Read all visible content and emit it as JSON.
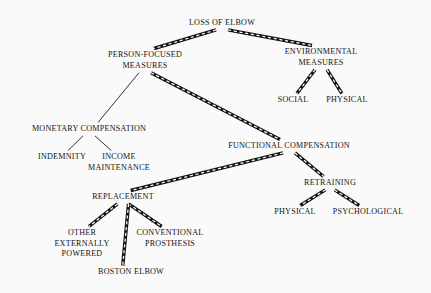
{
  "diagram": {
    "title": "LOSS OF ELBOW",
    "type": "hierarchy-tree",
    "background_color": "#fafafa",
    "text_color": "#141414",
    "line_styles": {
      "thin": "single thin solid black line",
      "thick": "thick double outline with white dashes between (railroad style)"
    },
    "nodes": [
      {
        "id": "loss-of-elbow",
        "label": "LOSS OF ELBOW",
        "x": 222,
        "y": 18,
        "level": 0
      },
      {
        "id": "person-focused-measures",
        "label": "PERSON-FOCUSED\nMEASURES",
        "x": 145,
        "y": 50,
        "level": 1
      },
      {
        "id": "environmental-measures",
        "label": "ENVIRONMENTAL\nMEASURES",
        "x": 321,
        "y": 47,
        "level": 1
      },
      {
        "id": "social",
        "label": "SOCIAL",
        "x": 293,
        "y": 95,
        "level": 2
      },
      {
        "id": "physical-env",
        "label": "PHYSICAL",
        "x": 347,
        "y": 95,
        "level": 2
      },
      {
        "id": "monetary-compensation",
        "label": "MONETARY COMPENSATION",
        "x": 89,
        "y": 124,
        "level": 2
      },
      {
        "id": "indemnity",
        "label": "INDEMNITY",
        "x": 62,
        "y": 152,
        "level": 3
      },
      {
        "id": "income-maintenance",
        "label": "INCOME\nMAINTENANCE",
        "x": 119,
        "y": 152,
        "level": 3
      },
      {
        "id": "functional-compensation",
        "label": "FUNCTIONAL COMPENSATION",
        "x": 289,
        "y": 141,
        "level": 2
      },
      {
        "id": "retraining",
        "label": "RETRAINING",
        "x": 330,
        "y": 178,
        "level": 3
      },
      {
        "id": "physical-retrain",
        "label": "PHYSICAL",
        "x": 295,
        "y": 207,
        "level": 4
      },
      {
        "id": "psychological",
        "label": "PSYCHOLOGICAL",
        "x": 368,
        "y": 207,
        "level": 4
      },
      {
        "id": "replacement",
        "label": "REPLACEMENT",
        "x": 123,
        "y": 192,
        "level": 3
      },
      {
        "id": "other-externally-powered",
        "label": "OTHER\nEXTERNALLY\nPOWERED",
        "x": 82,
        "y": 228,
        "level": 4
      },
      {
        "id": "conventional-prosthesis",
        "label": "CONVENTIONAL\nPROSTHESIS",
        "x": 170,
        "y": 228,
        "level": 4
      },
      {
        "id": "boston-elbow",
        "label": "BOSTON ELBOW",
        "x": 131,
        "y": 267,
        "level": 5
      }
    ],
    "edges": [
      {
        "from": "loss-of-elbow",
        "to": "person-focused-measures",
        "style": "thick"
      },
      {
        "from": "loss-of-elbow",
        "to": "environmental-measures",
        "style": "thick"
      },
      {
        "from": "environmental-measures",
        "to": "social",
        "style": "thick"
      },
      {
        "from": "environmental-measures",
        "to": "physical-env",
        "style": "thick"
      },
      {
        "from": "person-focused-measures",
        "to": "monetary-compensation",
        "style": "thin"
      },
      {
        "from": "person-focused-measures",
        "to": "functional-compensation",
        "style": "thick"
      },
      {
        "from": "monetary-compensation",
        "to": "indemnity",
        "style": "thin"
      },
      {
        "from": "monetary-compensation",
        "to": "income-maintenance",
        "style": "thin"
      },
      {
        "from": "functional-compensation",
        "to": "retraining",
        "style": "thick"
      },
      {
        "from": "functional-compensation",
        "to": "replacement",
        "style": "thick"
      },
      {
        "from": "retraining",
        "to": "physical-retrain",
        "style": "thick"
      },
      {
        "from": "retraining",
        "to": "psychological",
        "style": "thick"
      },
      {
        "from": "replacement",
        "to": "other-externally-powered",
        "style": "thick"
      },
      {
        "from": "replacement",
        "to": "conventional-prosthesis",
        "style": "thick"
      },
      {
        "from": "replacement",
        "to": "boston-elbow",
        "style": "thick"
      }
    ]
  }
}
